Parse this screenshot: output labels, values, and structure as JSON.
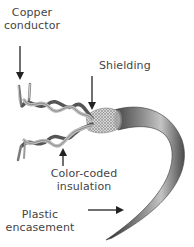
{
  "diagram": {
    "labels": {
      "copper_line1": "Copper",
      "copper_line2": "conductor",
      "shielding": "Shielding",
      "color_line1": "Color-coded",
      "color_line2": "insulation",
      "plastic_line1": "Plastic",
      "plastic_line2": "encasement"
    },
    "parts": [
      {
        "name": "Copper conductor",
        "arrow": "down",
        "target": "exposed wire tips"
      },
      {
        "name": "Shielding",
        "arrow": "down",
        "target": "braided mesh at cable end"
      },
      {
        "name": "Color-coded insulation",
        "arrow": "up",
        "target": "twisted wire pairs"
      },
      {
        "name": "Plastic encasement",
        "arrow": "right",
        "target": "outer jacket"
      }
    ],
    "colors": {
      "text": "#444444",
      "arrow": "#222222",
      "jacket_dark": "#3a3a3a",
      "jacket_light": "#b8b8b8",
      "wire_dark": "#555555",
      "wire_light": "#bdbdbd"
    }
  }
}
